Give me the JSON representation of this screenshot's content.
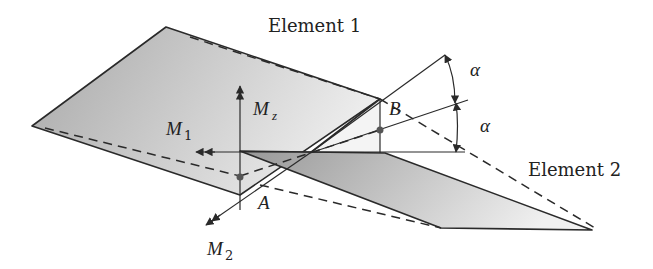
{
  "figure": {
    "width": 653,
    "height": 269,
    "colors": {
      "line": "#2a2a2a",
      "fill_element1_dark": "#a9a9a9",
      "fill_element1_light": "#e4e4e4",
      "fill_element2_dark": "#9c9c9c",
      "fill_element2_light": "#ececec",
      "background": "#ffffff"
    }
  },
  "labels": {
    "element1": "Element 1",
    "element2": "Element 2",
    "point_a": "A",
    "point_b": "B",
    "moment_1": "M",
    "moment_1_sub": "1",
    "moment_2": "M",
    "moment_2_sub": "2",
    "moment_z": "M",
    "moment_z_sub": "z",
    "angle_upper": "α",
    "angle_lower": "α"
  }
}
